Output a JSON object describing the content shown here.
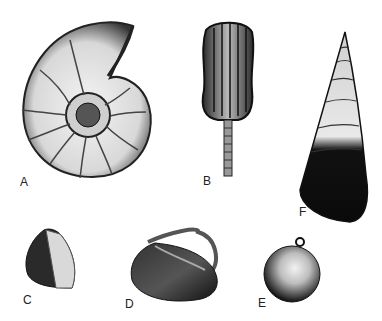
{
  "figure": {
    "specimens": [
      {
        "id": "A",
        "label": "A",
        "depicts": "ammonite"
      },
      {
        "id": "B",
        "label": "B",
        "depicts": "crinoid calyx with stem"
      },
      {
        "id": "C",
        "label": "C",
        "depicts": "brachiopod-like shell"
      },
      {
        "id": "D",
        "label": "D",
        "depicts": "bivalve with siphon"
      },
      {
        "id": "E",
        "label": "E",
        "depicts": "rounded gastropod shell"
      },
      {
        "id": "F",
        "label": "F",
        "depicts": "high-spired gastropod"
      }
    ]
  }
}
